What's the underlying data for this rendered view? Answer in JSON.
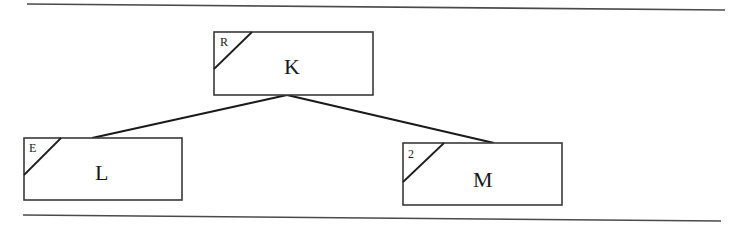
{
  "diagram": {
    "type": "tree",
    "nodes": [
      {
        "id": "K",
        "label": "K",
        "corner_tag": "R",
        "role": "root"
      },
      {
        "id": "L",
        "label": "L",
        "corner_tag": "E",
        "role": "left-child"
      },
      {
        "id": "M",
        "label": "M",
        "corner_tag": "2",
        "role": "right-child"
      }
    ],
    "edges": [
      {
        "from": "K",
        "to": "L"
      },
      {
        "from": "K",
        "to": "M"
      }
    ],
    "colors": {
      "line": "#1a1a1a",
      "box_border": "#3a3a3a",
      "background": "#ffffff"
    }
  }
}
